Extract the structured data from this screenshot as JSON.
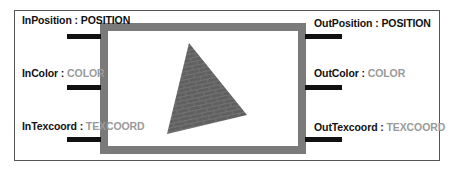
{
  "inputs": [
    {
      "name": "InPosition",
      "separator": " : ",
      "semantic": "POSITION"
    },
    {
      "name": "InColor",
      "separator": " : ",
      "semantic": "COLOR"
    },
    {
      "name": "InTexcoord",
      "separator": " : ",
      "semantic": "TEXCOORD"
    }
  ],
  "outputs": [
    {
      "name": "OutPosition",
      "separator": " : ",
      "semantic": "POSITION"
    },
    {
      "name": "OutColor",
      "separator": " : ",
      "semantic": "COLOR"
    },
    {
      "name": "OutTexcoord",
      "separator": " : ",
      "semantic": "TEXCOORD"
    }
  ],
  "preview": {
    "shape": "brick-textured-triangle-icon",
    "colors": {
      "box_border": "#7a7a7a",
      "triangle": "#5e5e5e",
      "stub": "#111111"
    }
  }
}
